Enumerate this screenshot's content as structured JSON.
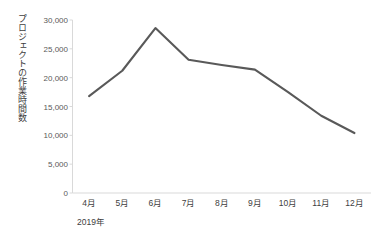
{
  "chart_data": {
    "type": "line",
    "title": "",
    "subtitle": "",
    "xlabel": "2019年",
    "ylabel": "プロジェクトの作業時間数",
    "categories": [
      "4月",
      "5月",
      "6月",
      "7月",
      "8月",
      "9月",
      "10月",
      "11月",
      "12月"
    ],
    "values": [
      16800,
      21200,
      28600,
      23100,
      22200,
      21400,
      17500,
      13400,
      10400
    ],
    "series": [
      {
        "name": "プロジェクトの作業時間数",
        "values": [
          16800,
          21200,
          28600,
          23100,
          22200,
          21400,
          17500,
          13400,
          10400
        ]
      }
    ],
    "ylim": [
      0,
      30000
    ],
    "ytick_values": [
      0,
      5000,
      10000,
      15000,
      20000,
      25000,
      30000
    ],
    "ytick_labels": [
      "0",
      "5,000",
      "10,000",
      "15,000",
      "20,000",
      "25,000",
      "30,000"
    ],
    "grid": false,
    "legend": "none",
    "line_color": "#595959",
    "axis_color": "#d9d9d9",
    "tick_label_color": "#595959",
    "axis_title_color": "#404040",
    "background": "#ffffff"
  }
}
